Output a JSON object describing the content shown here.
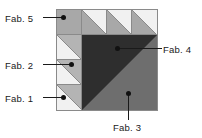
{
  "diagram": {
    "type": "quilt-block-piecing-diagram",
    "title": "",
    "grid": {
      "rows": 4,
      "cols": 4,
      "cell_px": 25
    },
    "colors": {
      "fab1_light": "#f1f1f1",
      "fab2_medium_light": "#b4b4b4",
      "fab3_medium": "#6e6e6e",
      "fab4_dark": "#2e2e2e",
      "fab5_gray": "#a8a8a8",
      "outline": "#8a8a8a",
      "dot": "#111111",
      "text": "#1a1a1a",
      "background": "#ffffff"
    },
    "labels": [
      {
        "id": "fab5",
        "text": "Fab. 5",
        "position": "left-top"
      },
      {
        "id": "fab2",
        "text": "Fab. 2",
        "position": "left-middle"
      },
      {
        "id": "fab1",
        "text": "Fab. 1",
        "position": "left-bottom"
      },
      {
        "id": "fab4",
        "text": "Fab. 4",
        "position": "right-upper"
      },
      {
        "id": "fab3",
        "text": "Fab. 3",
        "position": "bottom-center"
      }
    ],
    "units": [
      {
        "id": "r1c1",
        "row": 1,
        "col": 1,
        "kind": "solid-square",
        "fabric": "Fab. 5"
      },
      {
        "id": "r1c2",
        "row": 1,
        "col": 2,
        "kind": "half-square-triangle",
        "fabrics": "Fab. 5 / Fab. 1"
      },
      {
        "id": "r1c3",
        "row": 1,
        "col": 3,
        "kind": "half-square-triangle",
        "fabrics": "Fab. 5 / Fab. 1"
      },
      {
        "id": "r1c4",
        "row": 1,
        "col": 4,
        "kind": "half-square-triangle",
        "fabrics": "Fab. 5 / Fab. 1"
      },
      {
        "id": "r2c1",
        "row": 2,
        "col": 1,
        "kind": "half-square-triangle",
        "fabrics": "Fab. 2 / Fab. 1"
      },
      {
        "id": "r3c1",
        "row": 3,
        "col": 1,
        "kind": "half-square-triangle",
        "fabrics": "Fab. 2 / Fab. 1"
      },
      {
        "id": "r4c1",
        "row": 4,
        "col": 1,
        "kind": "half-square-triangle",
        "fabrics": "Fab. 2 / Fab. 1"
      },
      {
        "id": "big",
        "row": 2,
        "col": 2,
        "kind": "large-half-square-triangle",
        "span": "3x3",
        "fabrics": "Fab. 4 / Fab. 3"
      }
    ]
  }
}
